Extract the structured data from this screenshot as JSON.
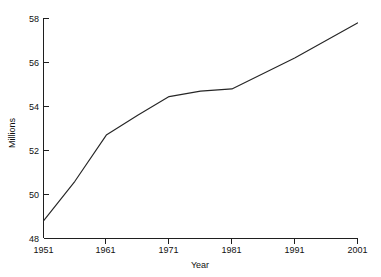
{
  "chart_data": {
    "type": "line",
    "title": "",
    "xlabel": "Year",
    "ylabel": "Millions",
    "xlim": [
      1951,
      2001
    ],
    "ylim": [
      48,
      58
    ],
    "grid": false,
    "legend": null,
    "x_ticks": [
      1951,
      1961,
      1971,
      1981,
      1991,
      2001
    ],
    "x_tick_labels": [
      "1951",
      "1961",
      "1971",
      "1981",
      "1991",
      "2001"
    ],
    "y_ticks": [
      48,
      50,
      52,
      54,
      56,
      58
    ],
    "y_tick_labels": [
      "48",
      "50",
      "52",
      "54",
      "56",
      "58"
    ],
    "line_color": "#262626",
    "series": [
      {
        "name": "Population",
        "x": [
          1951,
          1956,
          1961,
          1966,
          1971,
          1976,
          1981,
          1986,
          1991,
          1996,
          2001
        ],
        "values": [
          48.8,
          50.6,
          52.7,
          53.6,
          54.45,
          54.7,
          54.8,
          55.5,
          56.2,
          57.0,
          57.8
        ]
      }
    ]
  },
  "axes": {
    "y_label": "Millions",
    "x_label": "Year",
    "y_tick_0": "48",
    "y_tick_1": "50",
    "y_tick_2": "52",
    "y_tick_3": "54",
    "y_tick_4": "56",
    "y_tick_5": "58",
    "x_tick_0": "1951",
    "x_tick_1": "1961",
    "x_tick_2": "1971",
    "x_tick_3": "1981",
    "x_tick_4": "1991",
    "x_tick_5": "2001"
  }
}
